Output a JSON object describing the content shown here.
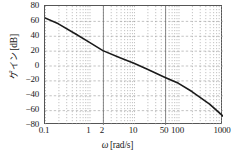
{
  "figure": {
    "kind": "bode-magnitude-plot",
    "x_axis_title_symbol": "ω",
    "x_axis_title_unit": "[rad/s]",
    "y_axis_title": "ゲイン [dB]",
    "y_axis_title_jp": "ゲイン",
    "y_axis_title_unit": "[dB]",
    "curve_color": "#1a1a1a",
    "grid_color": "#9a9a9a",
    "marker_line_color": "#6a6a6a",
    "frame_color": "#555555"
  },
  "chart_data": {
    "type": "line",
    "title": "",
    "xlabel": "ω [rad/s]",
    "ylabel": "ゲイン [dB]",
    "xscale": "log",
    "xlim": [
      0.1,
      1000
    ],
    "ylim": [
      -80,
      80
    ],
    "grid": true,
    "legend": "none",
    "xticks": [
      0.1,
      1,
      2,
      10,
      50,
      100,
      1000
    ],
    "xticklabels": [
      "0.1",
      "1",
      "2",
      "10",
      "50",
      "100",
      "1000"
    ],
    "yticks": [
      80,
      60,
      40,
      20,
      0,
      -20,
      -40,
      -60,
      -80
    ],
    "yticklabels": [
      "80",
      "60",
      "40",
      "20",
      "0",
      "−20",
      "−40",
      "−60",
      "−80"
    ],
    "vertical_marker_lines": [
      2,
      50
    ],
    "series": [
      {
        "name": "gain",
        "x": [
          0.1,
          0.2,
          0.5,
          1,
          2,
          5,
          10,
          20,
          50,
          100,
          200,
          500,
          1000
        ],
        "values": [
          64,
          56,
          42,
          31,
          20,
          10,
          3,
          -5,
          -16,
          -24,
          -35,
          -52,
          -68
        ]
      }
    ]
  }
}
